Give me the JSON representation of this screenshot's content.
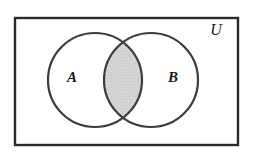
{
  "figure": {
    "type": "venn-diagram"
  },
  "labels": {
    "set_a": "A",
    "set_b": "B",
    "universe": "U"
  },
  "colors": {
    "stroke": "#2a2a2a",
    "circle_stroke": "#3c3c3c",
    "shade_fill": "#d2d2d2",
    "background": "#ffffff",
    "text": "#1a1a1a"
  },
  "geometry": {
    "rect": {
      "x": 15,
      "y": 18,
      "width": 223,
      "height": 127,
      "stroke_width": 2.4
    },
    "circle_a": {
      "cx": 95,
      "cy": 80,
      "r": 47,
      "stroke_width": 2.2
    },
    "circle_b": {
      "cx": 151,
      "cy": 80,
      "r": 47,
      "stroke_width": 2.2
    },
    "label_a_pos": {
      "x": 72,
      "y": 79
    },
    "label_b_pos": {
      "x": 173,
      "y": 79
    },
    "label_u_pos": {
      "x": 216,
      "y": 31
    },
    "intersection": {
      "shaded": true,
      "left": 103,
      "right": 143,
      "top": 37,
      "bottom": 122
    }
  }
}
